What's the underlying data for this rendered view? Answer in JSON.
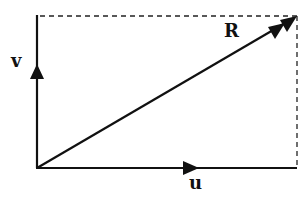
{
  "diagram": {
    "type": "vector-addition-parallelogram",
    "vectors": [
      {
        "name": "u",
        "label": "u",
        "direction": "horizontal",
        "from": [
          37,
          168
        ],
        "to": [
          297,
          168
        ]
      },
      {
        "name": "v",
        "label": "v",
        "direction": "vertical",
        "from": [
          37,
          168
        ],
        "to": [
          37,
          16
        ]
      },
      {
        "name": "R",
        "label": "R",
        "direction": "diagonal",
        "from": [
          37,
          168
        ],
        "to": [
          297,
          16
        ],
        "description": "resultant"
      }
    ],
    "guides": [
      {
        "name": "top-dashed",
        "from": [
          37,
          16
        ],
        "to": [
          297,
          16
        ],
        "style": "dashed"
      },
      {
        "name": "right-dashed",
        "from": [
          297,
          16
        ],
        "to": [
          297,
          168
        ],
        "style": "dashed"
      }
    ],
    "labels": {
      "v": "v",
      "u": "u",
      "R": "R"
    },
    "colors": {
      "stroke": "#111111",
      "background": "#ffffff"
    }
  }
}
